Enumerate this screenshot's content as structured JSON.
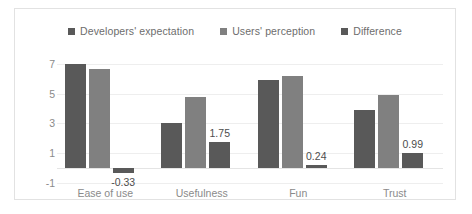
{
  "chart_data": {
    "type": "bar",
    "title": "",
    "xlabel": "",
    "ylabel": "",
    "categories": [
      "Ease of use",
      "Usefulness",
      "Fun",
      "Trust"
    ],
    "series": [
      {
        "name": "Developers' expectation",
        "color": "#595959",
        "values": [
          7.0,
          3.0,
          5.95,
          3.91
        ]
      },
      {
        "name": "Users' perception",
        "color": "#808080",
        "values": [
          6.67,
          4.75,
          6.19,
          4.9
        ]
      },
      {
        "name": "Difference",
        "color": "#595959",
        "values": [
          -0.33,
          1.75,
          0.24,
          0.99
        ],
        "data_labels": [
          "-0.33",
          "1.75",
          "0.24",
          "0.99"
        ]
      }
    ],
    "yticks": [
      -1,
      1,
      3,
      5,
      7
    ],
    "ytick_labels": [
      "-1",
      "1",
      "3",
      "5",
      "7"
    ],
    "ylim": [
      -1,
      7.6
    ],
    "grid": true,
    "legend_position": "top"
  },
  "legend": {
    "items": [
      {
        "label": "Developers' expectation",
        "color": "#595959"
      },
      {
        "label": "Users' perception",
        "color": "#808080"
      },
      {
        "label": "Difference",
        "color": "#595959"
      }
    ]
  }
}
